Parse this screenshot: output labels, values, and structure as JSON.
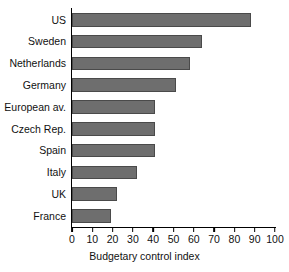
{
  "chart_data": {
    "type": "bar",
    "orientation": "horizontal",
    "title": "",
    "xlabel": "Budgetary control index",
    "ylabel": "",
    "xlim": [
      0,
      100
    ],
    "xticks": [
      0,
      10,
      20,
      30,
      40,
      50,
      60,
      70,
      80,
      90,
      100
    ],
    "grid": false,
    "legend": false,
    "bar_color": "#6e6e6e",
    "bar_edge_color": "#4a4a4a",
    "axis_color": "#000000",
    "categories": [
      "US",
      "Sweden",
      "Netherlands",
      "Germany",
      "European av.",
      "Czech Rep.",
      "Spain",
      "Italy",
      "UK",
      "France"
    ],
    "values": [
      88,
      64,
      58,
      51,
      41,
      41,
      41,
      32,
      22,
      19
    ]
  }
}
